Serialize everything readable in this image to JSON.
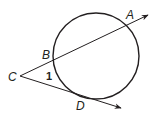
{
  "diagram": {
    "type": "circle with secant and tangent from external point",
    "circle": {
      "cx": 96,
      "cy": 56,
      "r": 43
    },
    "points": {
      "A": {
        "label": "A",
        "x": 129,
        "y": 18
      },
      "B": {
        "label": "B",
        "x": 47,
        "y": 57
      },
      "C": {
        "label": "C",
        "x": 9,
        "y": 79
      },
      "D": {
        "label": "D",
        "x": 77,
        "y": 108
      }
    },
    "angle_label": "1",
    "colors": {
      "stroke": "#231f20",
      "background": "#ffffff"
    }
  }
}
